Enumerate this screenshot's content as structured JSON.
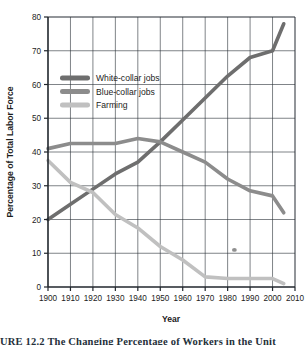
{
  "chart_data": {
    "type": "line",
    "title": "",
    "xlabel": "Year",
    "ylabel": "Percentage of Total Labor Force",
    "xlim": [
      1900,
      2010
    ],
    "ylim": [
      0,
      80
    ],
    "xticks": [
      1900,
      1910,
      1920,
      1930,
      1940,
      1950,
      1960,
      1970,
      1980,
      1990,
      2000,
      2010
    ],
    "yticks": [
      0,
      10,
      20,
      30,
      40,
      50,
      60,
      70,
      80
    ],
    "grid": true,
    "legend_position": "upper-left-inside",
    "series": [
      {
        "name": "White-collar jobs",
        "color": "#6e6e6e",
        "x": [
          1900,
          1910,
          1920,
          1930,
          1940,
          1950,
          1960,
          1970,
          1980,
          1990,
          2000,
          2005
        ],
        "values": [
          20,
          24.5,
          29,
          33.5,
          37,
          43,
          49.5,
          56,
          62.5,
          68,
          70,
          78
        ]
      },
      {
        "name": "Blue-collar jobs",
        "color": "#8c8c8c",
        "x": [
          1900,
          1910,
          1920,
          1930,
          1940,
          1950,
          1960,
          1970,
          1980,
          1990,
          2000,
          2005
        ],
        "values": [
          41,
          42.5,
          42.5,
          42.5,
          44,
          43,
          40,
          37,
          32,
          28.5,
          27,
          22
        ]
      },
      {
        "name": "Farming",
        "color": "#c0c0c0",
        "x": [
          1900,
          1910,
          1920,
          1930,
          1940,
          1950,
          1960,
          1970,
          1980,
          1990,
          2000,
          2005
        ],
        "values": [
          37.5,
          31,
          28,
          21.5,
          17.5,
          12,
          8,
          3,
          2.5,
          2.5,
          2.5,
          1
        ]
      }
    ],
    "annotations": [
      {
        "name": "ink-smudge",
        "x": 1983,
        "y": 11
      }
    ]
  },
  "caption": {
    "text": "URE 12.2   The Changing Percentage of Workers in the Unit"
  }
}
